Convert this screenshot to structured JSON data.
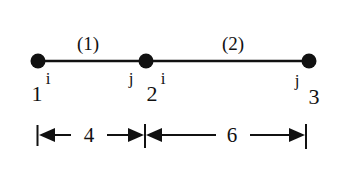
{
  "diagram": {
    "type": "finite-element-bar-mesh",
    "colors": {
      "ink": "#111111",
      "background": "#ffffff"
    },
    "nodes": [
      {
        "id": "1",
        "label": "1",
        "x": 38,
        "y": 61
      },
      {
        "id": "2",
        "label": "2",
        "x": 146,
        "y": 61
      },
      {
        "id": "3",
        "label": "3",
        "x": 309,
        "y": 61
      }
    ],
    "elements": [
      {
        "id": "1",
        "label": "(1)",
        "from": "1",
        "to": "2",
        "i_label": "i",
        "j_label": "j"
      },
      {
        "id": "2",
        "label": "(2)",
        "from": "2",
        "to": "3",
        "i_label": "i",
        "j_label": "j"
      }
    ],
    "dimensions": [
      {
        "label": "4",
        "from": "1",
        "to": "2"
      },
      {
        "label": "6",
        "from": "2",
        "to": "3"
      }
    ]
  }
}
